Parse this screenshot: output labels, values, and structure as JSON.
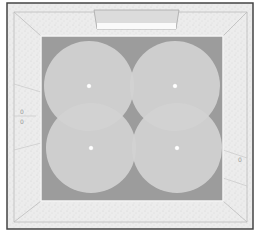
{
  "diagram": {
    "type": "room-light-coverage-plan",
    "colors": {
      "frame": "#444444",
      "wall": "#ebebeb",
      "floor": "#9c9c9c",
      "coverage": "#d2d2d2",
      "fixture": "#ffffff",
      "window": "#e0e0e0"
    },
    "fixtures": [
      {
        "id": "fixture-1",
        "cx": 89,
        "cy": 86,
        "r": 45
      },
      {
        "id": "fixture-2",
        "cx": 175,
        "cy": 86,
        "r": 45
      },
      {
        "id": "fixture-3",
        "cx": 91,
        "cy": 148,
        "r": 45
      },
      {
        "id": "fixture-4",
        "cx": 177,
        "cy": 148,
        "r": 45
      }
    ]
  }
}
